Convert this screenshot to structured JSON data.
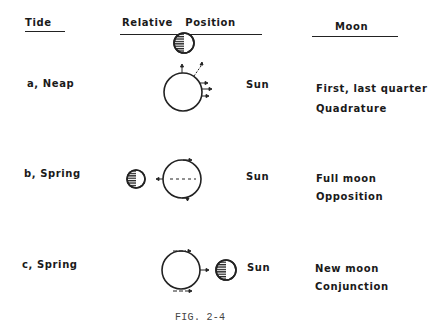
{
  "headers": {
    "tide": "Tide",
    "relative_position": "Relative   Position",
    "moon": "Moon"
  },
  "rows": [
    {
      "tide": "a, Neap",
      "sun": "Sun",
      "moon_line1": "First, last quarter",
      "moon_line2": "Quadrature"
    },
    {
      "tide": "b, Spring",
      "sun": "Sun",
      "moon_line1": "Full moon",
      "moon_line2": "Opposition"
    },
    {
      "tide": "c, Spring",
      "sun": "Sun",
      "moon_line1": "New moon",
      "moon_line2": "Conjunction"
    }
  ],
  "caption": "FIG. 2-4"
}
